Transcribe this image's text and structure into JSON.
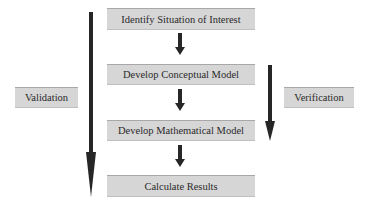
{
  "diagram": {
    "steps": [
      {
        "label": "Identify Situation of Interest"
      },
      {
        "label": "Develop Conceptual Model"
      },
      {
        "label": "Develop Mathematical Model"
      },
      {
        "label": "Calculate Results"
      }
    ],
    "side_labels": {
      "left": "Validation",
      "right": "Verification"
    },
    "colors": {
      "box_fill": "#d6d6d6",
      "arrow": "#262626",
      "text": "#2a2a2a"
    }
  }
}
